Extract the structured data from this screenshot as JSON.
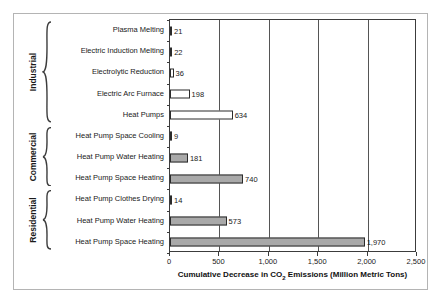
{
  "chart_data": {
    "type": "bar",
    "orientation": "horizontal",
    "title": "",
    "xlabel": "Cumulative Decrease in CO2 Emissions (Million Metric Tons)",
    "ylabel": "",
    "xlim": [
      0,
      2500
    ],
    "xticks": [
      0,
      500,
      1000,
      1500,
      2000,
      2500
    ],
    "xticklabels": [
      "0",
      "500",
      "1,000",
      "1,500",
      "2,000",
      "2,500"
    ],
    "grid": "vertical",
    "legend": "none",
    "categories": [
      "Plasma Melting",
      "Electric Induction Melting",
      "Electrolytic Reduction",
      "Electric Arc Furnace",
      "Heat Pumps",
      "Heat Pump Space Cooling",
      "Heat Pump Water Heating",
      "Heat Pump Space Heating",
      "Heat Pump Clothes Drying",
      "Heat Pump Water Heating",
      "Heat Pump Space Heating"
    ],
    "values": [
      21,
      22,
      36,
      198,
      634,
      9,
      181,
      740,
      14,
      573,
      1970
    ],
    "value_labels": [
      "21",
      "22",
      "36",
      "198",
      "634",
      "9",
      "181",
      "740",
      "14",
      "573",
      "1,970"
    ],
    "bar_styles": [
      "hollow",
      "hollow",
      "hollow",
      "hollow",
      "hollow",
      "filled",
      "filled",
      "filled",
      "filled",
      "filled",
      "filled"
    ],
    "groups": [
      {
        "label": "Industrial",
        "start": 0,
        "count": 5
      },
      {
        "label": "Commercial",
        "start": 5,
        "count": 3
      },
      {
        "label": "Residential",
        "start": 8,
        "count": 3
      }
    ],
    "colors": {
      "bar_fill_hollow": "#ffffff",
      "bar_fill_filled": "#a9a9a9",
      "bar_outline": "#2b2b2b",
      "gridline": "#555555",
      "axis": "#3c3c3c",
      "frame": "#b4b4b4",
      "text": "#1a1a1a"
    }
  }
}
